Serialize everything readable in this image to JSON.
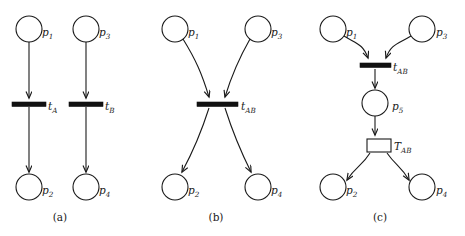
{
  "figure": {
    "width": 465,
    "height": 236,
    "background": "#ffffff",
    "ink": "#1a1a1a",
    "type": "petri-net-diagram",
    "panel_captions": [
      "(a)",
      "(b)",
      "(c)"
    ]
  },
  "panels": [
    {
      "id": "a",
      "caption": "(a)",
      "caption_pos": {
        "x": 60,
        "y": 221
      },
      "description": "Two independent transitions",
      "places": [
        {
          "name": "p1",
          "base": "p",
          "sub": "1",
          "cx": 29,
          "cy": 29,
          "r": 13,
          "label_x": 42,
          "label_y": 36
        },
        {
          "name": "p3",
          "base": "p",
          "sub": "3",
          "cx": 86,
          "cy": 29,
          "r": 13,
          "label_x": 99,
          "label_y": 36
        },
        {
          "name": "p2",
          "base": "p",
          "sub": "2",
          "cx": 29,
          "cy": 187,
          "r": 13,
          "label_x": 42,
          "label_y": 194
        },
        {
          "name": "p4",
          "base": "p",
          "sub": "4",
          "cx": 86,
          "cy": 187,
          "r": 13,
          "label_x": 99,
          "label_y": 194
        }
      ],
      "transitions": [
        {
          "name": "tA",
          "base": "t",
          "sub": "A",
          "kind": "bar",
          "x": 12,
          "y": 102,
          "w": 34,
          "h": 4.5,
          "label_x": 48,
          "label_y": 110
        },
        {
          "name": "tB",
          "base": "t",
          "sub": "B",
          "kind": "bar",
          "x": 69,
          "y": 102,
          "w": 34,
          "h": 4.5,
          "label_x": 105,
          "label_y": 110
        }
      ],
      "arcs": [
        {
          "from": "p1",
          "to": "tA",
          "path": "M29,42 L29,98"
        },
        {
          "from": "tA",
          "to": "p2",
          "path": "M29,107 L29,172"
        },
        {
          "from": "p3",
          "to": "tB",
          "path": "M86,42 L86,98"
        },
        {
          "from": "tB",
          "to": "p4",
          "path": "M86,107 L86,172"
        }
      ]
    },
    {
      "id": "b",
      "caption": "(b)",
      "caption_pos": {
        "x": 216,
        "y": 221
      },
      "description": "Single fused transition",
      "places": [
        {
          "name": "p1",
          "base": "p",
          "sub": "1",
          "cx": 175,
          "cy": 29,
          "r": 13,
          "label_x": 188,
          "label_y": 36
        },
        {
          "name": "p3",
          "base": "p",
          "sub": "3",
          "cx": 258,
          "cy": 29,
          "r": 13,
          "label_x": 271,
          "label_y": 36
        },
        {
          "name": "p2",
          "base": "p",
          "sub": "2",
          "cx": 175,
          "cy": 187,
          "r": 13,
          "label_x": 188,
          "label_y": 194
        },
        {
          "name": "p4",
          "base": "p",
          "sub": "4",
          "cx": 258,
          "cy": 187,
          "r": 13,
          "label_x": 271,
          "label_y": 194
        }
      ],
      "transitions": [
        {
          "name": "tAB",
          "base": "t",
          "sub": "AB",
          "kind": "bar",
          "x": 197,
          "y": 102,
          "w": 41,
          "h": 4.5,
          "label_x": 241,
          "label_y": 110
        }
      ],
      "arcs": [
        {
          "from": "p1",
          "to": "tAB",
          "path": "M183,39 C196,60 202,74 209,97"
        },
        {
          "from": "p3",
          "to": "tAB",
          "path": "M250,39 C238,60 232,74 225,97"
        },
        {
          "from": "tAB",
          "to": "p2",
          "path": "M209,108 C202,130 196,146 182,172"
        },
        {
          "from": "tAB",
          "to": "p4",
          "path": "M225,108 C232,130 238,146 251,172"
        }
      ]
    },
    {
      "id": "c",
      "caption": "(c)",
      "caption_pos": {
        "x": 380,
        "y": 221
      },
      "description": "Timed transition refinement with intermediate place",
      "places": [
        {
          "name": "p1",
          "base": "p",
          "sub": "1",
          "cx": 333,
          "cy": 29,
          "r": 13,
          "label_x": 346,
          "label_y": 36
        },
        {
          "name": "p3",
          "base": "p",
          "sub": "3",
          "cx": 422,
          "cy": 29,
          "r": 13,
          "label_x": 436,
          "label_y": 36
        },
        {
          "name": "p5",
          "base": "p",
          "sub": "5",
          "cx": 375,
          "cy": 103,
          "r": 13,
          "label_x": 392,
          "label_y": 110
        },
        {
          "name": "p2",
          "base": "p",
          "sub": "2",
          "cx": 333,
          "cy": 187,
          "r": 13,
          "label_x": 346,
          "label_y": 194
        },
        {
          "name": "p4",
          "base": "p",
          "sub": "4",
          "cx": 422,
          "cy": 187,
          "r": 13,
          "label_x": 436,
          "label_y": 194
        }
      ],
      "transitions": [
        {
          "name": "tAB",
          "base": "t",
          "sub": "AB",
          "kind": "bar",
          "x": 360,
          "y": 63,
          "w": 31,
          "h": 4.5,
          "label_x": 393,
          "label_y": 71
        },
        {
          "name": "TAB",
          "base": "T",
          "sub": "AB",
          "kind": "box",
          "x": 367,
          "y": 139,
          "w": 24,
          "h": 13,
          "label_x": 394,
          "label_y": 150
        }
      ],
      "arcs": [
        {
          "from": "p1",
          "to": "tAB",
          "path": "M344,36 C357,44 363,44 368,58"
        },
        {
          "from": "p3",
          "to": "tAB",
          "path": "M411,36 C398,44 391,44 386,58"
        },
        {
          "from": "tAB",
          "to": "p5",
          "path": "M375,69 L375,88"
        },
        {
          "from": "p5",
          "to": "TAB",
          "path": "M375,116 L375,135"
        },
        {
          "from": "TAB",
          "to": "p2",
          "path": "M370,153 C362,166 356,166 347,180"
        },
        {
          "from": "TAB",
          "to": "p4",
          "path": "M387,153 C396,166 401,166 409,180"
        }
      ]
    }
  ]
}
